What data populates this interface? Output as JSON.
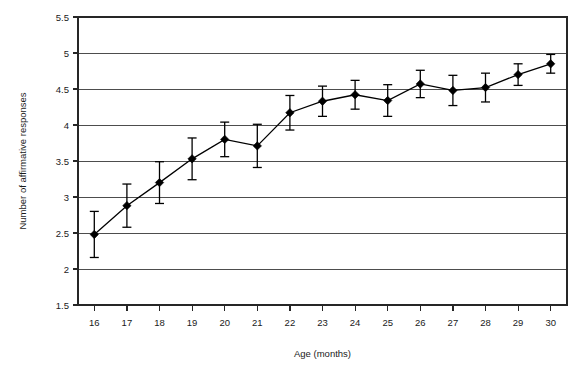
{
  "chart_data": {
    "type": "line",
    "title": "",
    "xlabel": "Age (months)",
    "ylabel": "Number of affirmative responses",
    "xlim": [
      15.5,
      30.5
    ],
    "ylim": [
      1.5,
      5.5
    ],
    "ytick_step": 0.5,
    "grid": "horizontal",
    "legend": "none",
    "x": [
      16,
      17,
      18,
      19,
      20,
      21,
      22,
      23,
      24,
      25,
      26,
      27,
      28,
      29,
      30
    ],
    "xtick_labels": [
      "16",
      "17",
      "18",
      "19",
      "20",
      "21",
      "22",
      "23",
      "24",
      "25",
      "26",
      "27",
      "28",
      "29",
      "30"
    ],
    "ytick_labels": [
      "1.5",
      "2",
      "2.5",
      "3",
      "3.5",
      "4",
      "4.5",
      "5",
      "5.5"
    ],
    "ytick_values": [
      1.5,
      2,
      2.5,
      3,
      3.5,
      4,
      4.5,
      5,
      5.5
    ],
    "series": [
      {
        "name": "Number of affirmative responses",
        "marker": "filled-diamond",
        "values": [
          2.48,
          2.88,
          3.2,
          3.53,
          3.8,
          3.71,
          4.17,
          4.33,
          4.42,
          4.34,
          4.57,
          4.48,
          4.52,
          4.7,
          4.85
        ],
        "errors": [
          0.32,
          0.3,
          0.29,
          0.29,
          0.24,
          0.3,
          0.24,
          0.21,
          0.2,
          0.22,
          0.19,
          0.21,
          0.2,
          0.15,
          0.13
        ]
      }
    ]
  },
  "colors": {
    "line": "#000000",
    "marker": "#000000",
    "grid": "#4d4d4d",
    "frame": "#262626",
    "background": "#ffffff"
  },
  "geometry": {
    "plot_left": 78,
    "plot_right": 567,
    "plot_top": 17,
    "plot_bottom": 305
  }
}
